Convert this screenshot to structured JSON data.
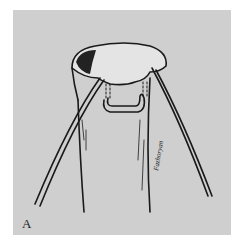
{
  "figure": {
    "panel_label": "A",
    "artist_signature": "Fazhoryan",
    "colors": {
      "background": "#cfcfcf",
      "ink": "#1a1a1a",
      "page": "#ffffff"
    }
  }
}
